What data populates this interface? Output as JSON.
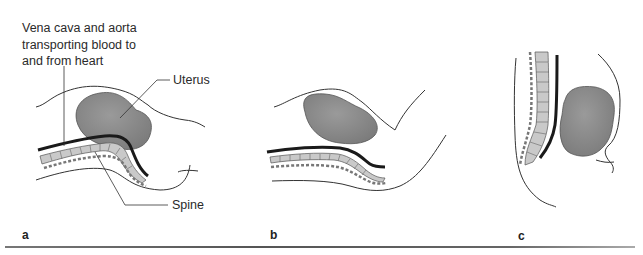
{
  "figure": {
    "panels": [
      {
        "id": "a",
        "label": "a"
      },
      {
        "id": "b",
        "label": "b"
      },
      {
        "id": "c",
        "label": "c"
      }
    ],
    "annotations": {
      "vessels_line1": "Vena cava and aorta",
      "vessels_line2": "transporting blood to",
      "vessels_line3": "and from heart",
      "uterus": "Uterus",
      "spine": "Spine"
    },
    "colors": {
      "uterus_fill": "#8a8a8a",
      "vessel": "#1a1a1a",
      "vertebra_fill": "#c9c9c9",
      "outline": "#333333",
      "rule": "#666666"
    }
  }
}
